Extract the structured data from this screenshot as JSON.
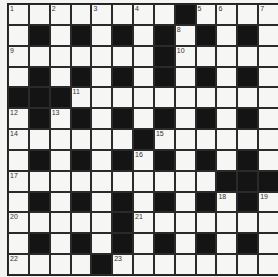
{
  "puzzle": {
    "type": "crossword",
    "size": {
      "rows": 13,
      "cols": 13
    },
    "colors": {
      "black": "#141414",
      "white": "#f6f6f4",
      "line": "#2a2a2a"
    },
    "layout": [
      "........#....",
      ".#.#.#.#.#.#.",
      ".......#.....",
      ".#.#.#.#.#.#.",
      "###..........",
      ".#.#.#.#.#.#.",
      "......#......",
      ".#.#.#.#.#.#.",
      "..........###",
      ".#.#.#.#.#.#.",
      ".....#.......",
      ".#.#.#.#.#.#.",
      "....#........"
    ],
    "numbers": [
      {
        "n": "1",
        "r": 0,
        "c": 0
      },
      {
        "n": "2",
        "r": 0,
        "c": 2
      },
      {
        "n": "3",
        "r": 0,
        "c": 4
      },
      {
        "n": "4",
        "r": 0,
        "c": 6
      },
      {
        "n": "5",
        "r": 0,
        "c": 9
      },
      {
        "n": "6",
        "r": 0,
        "c": 10
      },
      {
        "n": "7",
        "r": 0,
        "c": 12
      },
      {
        "n": "8",
        "r": 1,
        "c": 8
      },
      {
        "n": "9",
        "r": 2,
        "c": 0
      },
      {
        "n": "10",
        "r": 2,
        "c": 8
      },
      {
        "n": "11",
        "r": 4,
        "c": 3
      },
      {
        "n": "12",
        "r": 5,
        "c": 0
      },
      {
        "n": "13",
        "r": 5,
        "c": 2
      },
      {
        "n": "14",
        "r": 6,
        "c": 0
      },
      {
        "n": "15",
        "r": 6,
        "c": 7
      },
      {
        "n": "16",
        "r": 7,
        "c": 6
      },
      {
        "n": "17",
        "r": 8,
        "c": 0
      },
      {
        "n": "18",
        "r": 9,
        "c": 10
      },
      {
        "n": "19",
        "r": 9,
        "c": 12
      },
      {
        "n": "20",
        "r": 10,
        "c": 0
      },
      {
        "n": "21",
        "r": 10,
        "c": 6
      },
      {
        "n": "22",
        "r": 12,
        "c": 0
      },
      {
        "n": "23",
        "r": 12,
        "c": 5
      }
    ]
  }
}
